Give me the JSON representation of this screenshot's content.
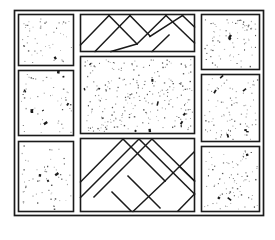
{
  "figure": {
    "description": "Rectangular paving plan: three stippled stone panels in the left column, three stippled stone panels in the right column, one large stippled stone panel in the centre, with herringbone brick courses above and below the centre panel.",
    "canvas": {
      "width": 275,
      "height": 229
    },
    "background_color": "#ffffff",
    "line_color": "#1a1a1a",
    "fill_color": "#ffffff"
  },
  "frame": {
    "label": "outer-boundary",
    "x": 14,
    "y": 10,
    "width": 250,
    "height": 206
  },
  "panels": [
    {
      "id": "left-top",
      "label": "Stippled stone panel, left column, top",
      "type": "stipple",
      "x": 18,
      "y": 14,
      "width": 56,
      "height": 52,
      "speck_count": 52
    },
    {
      "id": "left-middle",
      "label": "Stippled stone panel, left column, middle",
      "type": "stipple",
      "x": 18,
      "y": 70,
      "width": 56,
      "height": 66,
      "speck_count": 56
    },
    {
      "id": "left-bottom",
      "label": "Stippled stone panel, left column, bottom",
      "type": "stipple",
      "x": 18,
      "y": 141,
      "width": 56,
      "height": 71,
      "speck_count": 60
    },
    {
      "id": "center-top",
      "label": "Herringbone brick course, above centre",
      "type": "herringbone",
      "x": 80,
      "y": 14,
      "width": 115,
      "height": 38,
      "direction": "up"
    },
    {
      "id": "center-main",
      "label": "Large stippled stone panel, centre",
      "type": "stipple",
      "x": 80,
      "y": 56,
      "width": 115,
      "height": 78,
      "speck_count": 260
    },
    {
      "id": "center-bottom",
      "label": "Herringbone brick course, below centre",
      "type": "herringbone",
      "x": 80,
      "y": 138,
      "width": 115,
      "height": 74,
      "direction": "down"
    },
    {
      "id": "right-top",
      "label": "Stippled stone panel, right column, top",
      "type": "stipple",
      "x": 201,
      "y": 14,
      "width": 59,
      "height": 56,
      "speck_count": 80
    },
    {
      "id": "right-middle",
      "label": "Stippled stone panel, right column, middle",
      "type": "stipple",
      "x": 201,
      "y": 74,
      "width": 59,
      "height": 68,
      "speck_count": 90
    },
    {
      "id": "right-bottom",
      "label": "Stippled stone panel, right column, bottom",
      "type": "stipple",
      "x": 201,
      "y": 146,
      "width": 59,
      "height": 66,
      "speck_count": 85
    }
  ],
  "legend": {
    "stipple_meaning": "stone / concrete slab (stippled fill)",
    "herringbone_meaning": "brick paving laid in herringbone bond"
  }
}
